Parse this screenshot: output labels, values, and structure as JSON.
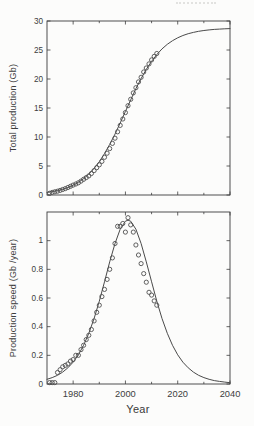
{
  "figure": {
    "background": "#fcfcfb",
    "ink_color": "#3d3d3d",
    "curve_color": "#4a4a4a",
    "marker_color": "#4f4f4f"
  },
  "chart_data": [
    {
      "type": "line",
      "title": "",
      "xlabel": "",
      "ylabel": "Total production  (Gb)",
      "xlim": [
        1970,
        2040
      ],
      "ylim": [
        0,
        30
      ],
      "yticks": [
        0,
        5,
        10,
        15,
        20,
        25,
        30
      ],
      "ytick_labels": [
        "0",
        "5",
        "10",
        "15",
        "20",
        "25",
        "30"
      ],
      "xticks_major": [
        1980,
        2000,
        2020,
        2040
      ],
      "xticks_minor": [
        1990,
        2010,
        2030
      ],
      "xtick_labels": [],
      "grid": false,
      "legend": "none",
      "series": [
        {
          "name": "logistic-fit-curve",
          "type": "line",
          "points": [
            [
              1970,
              0.44
            ],
            [
              1972,
              0.58
            ],
            [
              1974,
              0.76
            ],
            [
              1976,
              0.99
            ],
            [
              1978,
              1.3
            ],
            [
              1980,
              1.69
            ],
            [
              1982,
              2.19
            ],
            [
              1984,
              2.82
            ],
            [
              1986,
              3.6
            ],
            [
              1988,
              4.58
            ],
            [
              1990,
              5.75
            ],
            [
              1992,
              7.13
            ],
            [
              1994,
              8.72
            ],
            [
              1996,
              10.5
            ],
            [
              1998,
              12.41
            ],
            [
              2000,
              14.4
            ],
            [
              2002,
              16.39
            ],
            [
              2004,
              18.35
            ],
            [
              2006,
              20.07
            ],
            [
              2008,
              21.67
            ],
            [
              2010,
              23.05
            ],
            [
              2012,
              24.21
            ],
            [
              2014,
              25.19
            ],
            [
              2016,
              25.98
            ],
            [
              2018,
              26.61
            ],
            [
              2020,
              27.11
            ],
            [
              2022,
              27.5
            ],
            [
              2024,
              27.81
            ],
            [
              2026,
              28.04
            ],
            [
              2028,
              28.22
            ],
            [
              2030,
              28.36
            ],
            [
              2032,
              28.47
            ],
            [
              2034,
              28.55
            ],
            [
              2036,
              28.61
            ],
            [
              2038,
              28.65
            ],
            [
              2040,
              28.69
            ]
          ]
        },
        {
          "name": "observed-cumulative-production",
          "type": "scatter",
          "points": [
            [
              1971,
              0.3
            ],
            [
              1972,
              0.45
            ],
            [
              1973,
              0.55
            ],
            [
              1974,
              0.65
            ],
            [
              1975,
              0.8
            ],
            [
              1976,
              0.95
            ],
            [
              1977,
              1.1
            ],
            [
              1978,
              1.3
            ],
            [
              1979,
              1.5
            ],
            [
              1980,
              1.7
            ],
            [
              1981,
              1.9
            ],
            [
              1982,
              2.1
            ],
            [
              1983,
              2.4
            ],
            [
              1984,
              2.7
            ],
            [
              1985,
              3.0
            ],
            [
              1986,
              3.3
            ],
            [
              1987,
              3.7
            ],
            [
              1988,
              4.2
            ],
            [
              1989,
              4.7
            ],
            [
              1990,
              5.2
            ],
            [
              1991,
              5.8
            ],
            [
              1992,
              6.5
            ],
            [
              1993,
              7.2
            ],
            [
              1994,
              8.0
            ],
            [
              1995,
              8.9
            ],
            [
              1996,
              9.8
            ],
            [
              1997,
              10.9
            ],
            [
              1998,
              12.0
            ],
            [
              1999,
              13.1
            ],
            [
              2000,
              14.2
            ],
            [
              2001,
              15.4
            ],
            [
              2002,
              16.5
            ],
            [
              2003,
              17.6
            ],
            [
              2004,
              18.5
            ],
            [
              2005,
              19.5
            ],
            [
              2006,
              20.3
            ],
            [
              2007,
              21.2
            ],
            [
              2008,
              21.9
            ],
            [
              2009,
              22.6
            ],
            [
              2010,
              23.3
            ],
            [
              2011,
              23.9
            ],
            [
              2012,
              24.4
            ]
          ]
        }
      ]
    },
    {
      "type": "line",
      "title": "",
      "xlabel": "Year",
      "ylabel": "Production speed  (Gb /year)",
      "xlim": [
        1970,
        2040
      ],
      "ylim": [
        0,
        1.2
      ],
      "yticks": [
        0,
        0.2,
        0.4,
        0.6,
        0.8,
        1
      ],
      "ytick_labels": [
        "0",
        "0.2",
        "0.4",
        "0.6",
        "0.8",
        "1"
      ],
      "xticks_major": [
        1980,
        2000,
        2020,
        2040
      ],
      "xticks_minor": [
        1990,
        2010,
        2030
      ],
      "xtick_labels": [
        "1980",
        "2000",
        "2020",
        "2040"
      ],
      "grid": false,
      "legend": "none",
      "series": [
        {
          "name": "production-speed-fit-curve",
          "type": "line",
          "points": [
            [
              1970,
              0.033
            ],
            [
              1972,
              0.045
            ],
            [
              1974,
              0.061
            ],
            [
              1976,
              0.083
            ],
            [
              1978,
              0.113
            ],
            [
              1980,
              0.152
            ],
            [
              1982,
              0.204
            ],
            [
              1984,
              0.27
            ],
            [
              1986,
              0.354
            ],
            [
              1988,
              0.457
            ],
            [
              1990,
              0.578
            ],
            [
              1992,
              0.713
            ],
            [
              1994,
              0.852
            ],
            [
              1996,
              0.98
            ],
            [
              1998,
              1.08
            ],
            [
              2000,
              1.136
            ],
            [
              2001,
              1.143
            ],
            [
              2002,
              1.136
            ],
            [
              2004,
              1.08
            ],
            [
              2006,
              0.98
            ],
            [
              2008,
              0.852
            ],
            [
              2010,
              0.713
            ],
            [
              2012,
              0.578
            ],
            [
              2014,
              0.457
            ],
            [
              2016,
              0.354
            ],
            [
              2018,
              0.27
            ],
            [
              2020,
              0.204
            ],
            [
              2022,
              0.152
            ],
            [
              2024,
              0.113
            ],
            [
              2026,
              0.083
            ],
            [
              2028,
              0.061
            ],
            [
              2030,
              0.045
            ],
            [
              2032,
              0.033
            ],
            [
              2034,
              0.024
            ],
            [
              2036,
              0.018
            ],
            [
              2038,
              0.013
            ],
            [
              2040,
              0.009
            ]
          ]
        },
        {
          "name": "observed-production-speed",
          "type": "scatter",
          "points": [
            [
              1971,
              0.01
            ],
            [
              1972,
              0.01
            ],
            [
              1973,
              0.01
            ],
            [
              1974,
              0.08
            ],
            [
              1975,
              0.1
            ],
            [
              1976,
              0.12
            ],
            [
              1977,
              0.13
            ],
            [
              1978,
              0.14
            ],
            [
              1979,
              0.16
            ],
            [
              1980,
              0.17
            ],
            [
              1981,
              0.2
            ],
            [
              1982,
              0.2
            ],
            [
              1983,
              0.24
            ],
            [
              1984,
              0.27
            ],
            [
              1985,
              0.31
            ],
            [
              1986,
              0.34
            ],
            [
              1987,
              0.38
            ],
            [
              1988,
              0.44
            ],
            [
              1989,
              0.5
            ],
            [
              1990,
              0.55
            ],
            [
              1991,
              0.61
            ],
            [
              1992,
              0.66
            ],
            [
              1993,
              0.73
            ],
            [
              1994,
              0.8
            ],
            [
              1995,
              0.88
            ],
            [
              1996,
              0.98
            ],
            [
              1997,
              1.1
            ],
            [
              1998,
              1.1
            ],
            [
              1999,
              1.12
            ],
            [
              2000,
              1.06
            ],
            [
              2001,
              1.16
            ],
            [
              2002,
              1.11
            ],
            [
              2003,
              1.06
            ],
            [
              2004,
              0.97
            ],
            [
              2005,
              0.9
            ],
            [
              2006,
              0.84
            ],
            [
              2007,
              0.77
            ],
            [
              2008,
              0.71
            ],
            [
              2009,
              0.64
            ],
            [
              2010,
              0.62
            ],
            [
              2011,
              0.58
            ],
            [
              2012,
              0.55
            ]
          ]
        }
      ]
    }
  ]
}
